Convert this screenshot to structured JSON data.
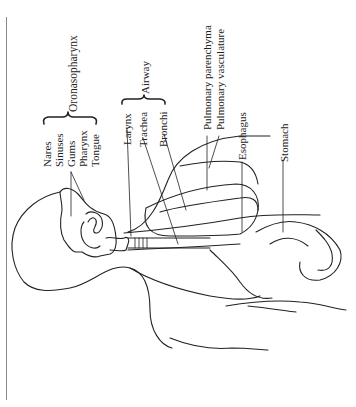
{
  "figure": {
    "orientation": "rotated-90-ccw",
    "groups": {
      "oronasopharynx": "Oronasopharynx",
      "airway": "Airway"
    },
    "labels": {
      "nares": "Nares",
      "sinuses": "Sinuses",
      "gums": "Gums",
      "pharynx": "Pharynx",
      "tongue": "Tongue",
      "larynx": "Larynx",
      "trachea": "Trachea",
      "bronchi": "Bronchi",
      "pulmonary_parenchyma": "Pulmonary parenchyma",
      "pulmonary_vasculature": "Pulmonary vasculature",
      "esophagus": "Esophagus",
      "stomach": "Stomach"
    },
    "colors": {
      "ink": "#222222",
      "border": "#8a8a8a",
      "background": "#ffffff"
    }
  }
}
